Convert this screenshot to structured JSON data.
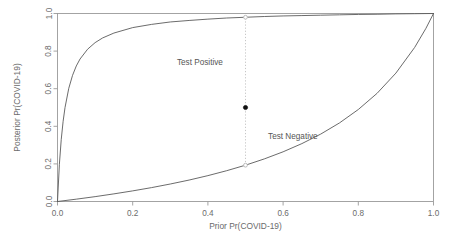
{
  "chart_data": {
    "type": "line",
    "title": "",
    "xlabel": "Prior Pr(COVID-19)",
    "ylabel": "Posterior Pr(COVID-19)",
    "xlim": [
      0.0,
      1.0
    ],
    "ylim": [
      0.0,
      1.0
    ],
    "grid": false,
    "legend_position": "none",
    "xticks": [
      "0.0",
      "0.2",
      "0.4",
      "0.6",
      "0.8",
      "1.0"
    ],
    "xtick_values": [
      0.0,
      0.2,
      0.4,
      0.6,
      0.8,
      1.0
    ],
    "yticks": [
      "0.0",
      "0.2",
      "0.4",
      "0.6",
      "0.8",
      "1.0"
    ],
    "ytick_values": [
      0.0,
      0.2,
      0.4,
      0.6,
      0.8,
      1.0
    ],
    "series": [
      {
        "name": "Test Positive",
        "likelihood_ratio": 49.0,
        "x": [
          0.0,
          0.005,
          0.01,
          0.015,
          0.02,
          0.03,
          0.04,
          0.05,
          0.06,
          0.08,
          0.1,
          0.12,
          0.15,
          0.2,
          0.25,
          0.3,
          0.35,
          0.4,
          0.45,
          0.5,
          0.55,
          0.6,
          0.65,
          0.7,
          0.75,
          0.8,
          0.85,
          0.9,
          0.95,
          1.0
        ],
        "y": [
          0.0,
          0.198,
          0.331,
          0.427,
          0.5,
          0.602,
          0.671,
          0.721,
          0.758,
          0.81,
          0.845,
          0.87,
          0.896,
          0.925,
          0.942,
          0.955,
          0.963,
          0.97,
          0.976,
          0.98,
          0.984,
          0.987,
          0.989,
          0.991,
          0.993,
          0.995,
          0.996,
          0.998,
          0.999,
          1.0
        ]
      },
      {
        "name": "Test Negative",
        "likelihood_ratio": 0.2395,
        "x": [
          0.0,
          0.05,
          0.1,
          0.15,
          0.2,
          0.25,
          0.3,
          0.35,
          0.4,
          0.45,
          0.5,
          0.55,
          0.6,
          0.65,
          0.7,
          0.75,
          0.8,
          0.85,
          0.9,
          0.95,
          0.98,
          1.0
        ],
        "y": [
          0.0,
          0.0124,
          0.0258,
          0.0406,
          0.0565,
          0.0739,
          0.0931,
          0.1141,
          0.1376,
          0.1639,
          0.1932,
          0.2265,
          0.2643,
          0.308,
          0.3585,
          0.418,
          0.4893,
          0.5755,
          0.683,
          0.8198,
          0.9214,
          1.0
        ]
      }
    ],
    "annotations": [
      {
        "label": "Test Positive",
        "x": 0.44,
        "y": 0.74,
        "align": "end"
      },
      {
        "label": "Test Negative",
        "x": 0.56,
        "y": 0.345,
        "align": "start"
      }
    ],
    "markers": [
      {
        "name": "positive-intersection",
        "x": 0.5,
        "y": 0.98,
        "style": "open"
      },
      {
        "name": "selected-prior-point",
        "x": 0.5,
        "y": 0.5,
        "style": "solid"
      },
      {
        "name": "negative-intersection",
        "x": 0.5,
        "y": 0.1932,
        "style": "open"
      }
    ],
    "guide_line": {
      "x": 0.5,
      "y_from": 0.1932,
      "y_to": 0.98
    },
    "colors": {
      "background": "#ffffff",
      "curve": "#5a5a5a",
      "frame": "#9a9a9a",
      "guide": "#c0c0c0",
      "solid_marker": "#111111",
      "text": "#6b6b6b"
    }
  }
}
